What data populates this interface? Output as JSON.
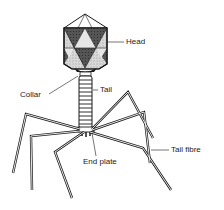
{
  "diagram": {
    "labels": {
      "head": "Head",
      "collar": "Collar",
      "tail": "Tail",
      "end_plate": "End plate",
      "tail_fibre": "Tail fibre"
    },
    "colors": {
      "line": "#1a1a1a",
      "dark_facet": "#4a4a4a",
      "light_facet": "#cfcfcf",
      "background": "#ffffff"
    }
  }
}
